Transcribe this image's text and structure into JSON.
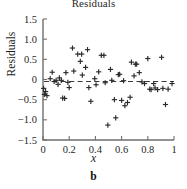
{
  "chart_data": {
    "type": "scatter",
    "title": "Residuals",
    "xlabel": "x",
    "ylabel": "Residuals",
    "panel_caption": "b",
    "xlim": [
      0,
      1
    ],
    "ylim": [
      -1.5,
      1.5
    ],
    "xticks": [
      0,
      0.2,
      0.4,
      0.6,
      0.8,
      1
    ],
    "xtick_labels": [
      "0",
      "0.2",
      "0.4",
      "0.6",
      "0.8",
      "1"
    ],
    "yticks": [
      -1.5,
      -1.0,
      -0.5,
      0,
      0.5,
      1.0,
      1.5
    ],
    "ytick_labels": [
      "−1.5",
      "−1.0",
      "−0.5",
      "0",
      "0.5",
      "1.0",
      "1.5"
    ],
    "grid": false,
    "legend": null,
    "marker": "plus",
    "marker_color": "#2a2a2a",
    "reference_line": {
      "kind": "horizontal",
      "y": -0.05,
      "style": "dashed",
      "color": "#3a3a3a"
    },
    "points": [
      {
        "x": 0.005,
        "y": -0.22
      },
      {
        "x": 0.01,
        "y": -0.37
      },
      {
        "x": 0.02,
        "y": -0.3
      },
      {
        "x": 0.03,
        "y": -0.4
      },
      {
        "x": 0.055,
        "y": 0.02
      },
      {
        "x": 0.07,
        "y": 0.18
      },
      {
        "x": 0.085,
        "y": -0.05
      },
      {
        "x": 0.1,
        "y": -0.02
      },
      {
        "x": 0.115,
        "y": -0.12
      },
      {
        "x": 0.125,
        "y": 0.04
      },
      {
        "x": 0.14,
        "y": -0.02
      },
      {
        "x": 0.15,
        "y": -0.46
      },
      {
        "x": 0.165,
        "y": -0.47
      },
      {
        "x": 0.175,
        "y": 0.17
      },
      {
        "x": 0.19,
        "y": -0.07
      },
      {
        "x": 0.2,
        "y": -0.2
      },
      {
        "x": 0.225,
        "y": 0.78
      },
      {
        "x": 0.235,
        "y": 0.21
      },
      {
        "x": 0.265,
        "y": 0.63
      },
      {
        "x": 0.285,
        "y": 0.45
      },
      {
        "x": 0.295,
        "y": 0.63
      },
      {
        "x": 0.3,
        "y": 0.11
      },
      {
        "x": 0.325,
        "y": 0.3
      },
      {
        "x": 0.34,
        "y": 0.74
      },
      {
        "x": 0.35,
        "y": -0.2
      },
      {
        "x": 0.365,
        "y": -0.54
      },
      {
        "x": 0.395,
        "y": 0.02
      },
      {
        "x": 0.405,
        "y": -0.13
      },
      {
        "x": 0.425,
        "y": 0.19
      },
      {
        "x": 0.445,
        "y": 0.6
      },
      {
        "x": 0.465,
        "y": 0.6
      },
      {
        "x": 0.475,
        "y": -0.08
      },
      {
        "x": 0.495,
        "y": -1.13
      },
      {
        "x": 0.515,
        "y": 0.25
      },
      {
        "x": 0.525,
        "y": -0.02
      },
      {
        "x": 0.545,
        "y": -0.5
      },
      {
        "x": 0.555,
        "y": -0.95
      },
      {
        "x": 0.575,
        "y": 0.12
      },
      {
        "x": 0.585,
        "y": 0.13
      },
      {
        "x": 0.6,
        "y": -0.52
      },
      {
        "x": 0.615,
        "y": -0.03
      },
      {
        "x": 0.625,
        "y": -0.65
      },
      {
        "x": 0.645,
        "y": -0.57
      },
      {
        "x": 0.665,
        "y": -0.44
      },
      {
        "x": 0.675,
        "y": 0.43
      },
      {
        "x": 0.695,
        "y": 0.09
      },
      {
        "x": 0.705,
        "y": 0.38
      },
      {
        "x": 0.715,
        "y": 0.38
      },
      {
        "x": 0.735,
        "y": 0.17
      },
      {
        "x": 0.755,
        "y": -0.06
      },
      {
        "x": 0.775,
        "y": -0.1
      },
      {
        "x": 0.8,
        "y": 0.52
      },
      {
        "x": 0.815,
        "y": -0.24
      },
      {
        "x": 0.825,
        "y": -0.25
      },
      {
        "x": 0.845,
        "y": -0.1
      },
      {
        "x": 0.855,
        "y": -0.21
      },
      {
        "x": 0.875,
        "y": -0.25
      },
      {
        "x": 0.905,
        "y": 0.55
      },
      {
        "x": 0.915,
        "y": -0.22
      },
      {
        "x": 0.935,
        "y": -0.62
      },
      {
        "x": 0.955,
        "y": -0.24
      },
      {
        "x": 0.985,
        "y": -0.1
      }
    ]
  }
}
